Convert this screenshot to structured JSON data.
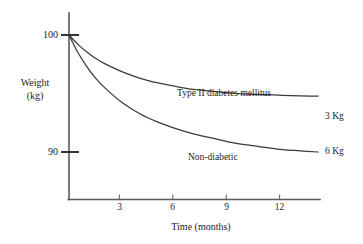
{
  "chart_data": {
    "type": "line",
    "title": "",
    "xlabel": "Time (months)",
    "ylabel": "Weight (kg)",
    "ylabel_line1": "Weight",
    "ylabel_line2": "(kg)",
    "xlim": [
      0,
      14.1
    ],
    "ylim": [
      88.2,
      100.9
    ],
    "grid": false,
    "legend_position": "inline-annotations",
    "x_ticks": [
      "3",
      "6",
      "9",
      "12"
    ],
    "x_tick_values": [
      3,
      6,
      9,
      12
    ],
    "y_ticks": [
      "100",
      "90"
    ],
    "y_tick_values": [
      100,
      90
    ],
    "axis_color": "#5a5a5a",
    "curve_color": "#3a3a3a",
    "series": [
      {
        "name": "Type II diabetes mellitus",
        "label": "Type II diabetes mellitus",
        "end_label": "3 Kg",
        "total_loss_kg": 3,
        "x": [
          0,
          0.5,
          1,
          1.5,
          2,
          3,
          4,
          5,
          6,
          7,
          8,
          9,
          10,
          11,
          12,
          13,
          14
        ],
        "values": [
          100,
          99.2,
          98.55,
          98.0,
          97.55,
          96.85,
          96.3,
          95.9,
          95.6,
          95.35,
          95.2,
          95.05,
          94.95,
          94.9,
          94.85,
          94.8,
          94.78
        ]
      },
      {
        "name": "Non-diabetic",
        "label": "Non-diabetic",
        "end_label": "6 Kg",
        "total_loss_kg": 6,
        "x": [
          0,
          0.5,
          1,
          1.5,
          2,
          3,
          4,
          5,
          6,
          7,
          8,
          9,
          10,
          11,
          12,
          13,
          14
        ],
        "values": [
          100,
          98.5,
          97.3,
          96.3,
          95.5,
          94.2,
          93.25,
          92.55,
          92.0,
          91.55,
          91.2,
          90.85,
          90.6,
          90.4,
          90.2,
          90.1,
          90.0
        ]
      }
    ],
    "annotations": [
      {
        "text": "Type II diabetes mellitus",
        "for_series": "Type II diabetes mellitus"
      },
      {
        "text": "Non-diabetic",
        "for_series": "Non-diabetic"
      },
      {
        "text": "3 Kg",
        "for_series": "Type II diabetes mellitus"
      },
      {
        "text": "6 Kg",
        "for_series": "Non-diabetic"
      }
    ]
  }
}
